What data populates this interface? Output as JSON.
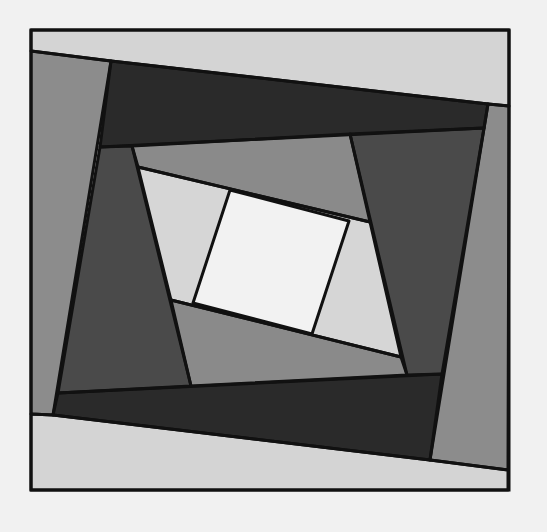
{
  "figure": {
    "frame": {
      "x1": 31,
      "y1": 30,
      "x2": 509,
      "y2": 490,
      "stroke": "#111111"
    },
    "colors": {
      "background": "#f1f1f1",
      "outline": "#111111",
      "center": "#f2f2f2",
      "ring3_light": "#d6d6d6",
      "ring2_medium": "#8a8a8a",
      "ring2_dark": "#4a4a4a",
      "outer_medium": "#8c8c8c",
      "outer_dark": "#2a2a2a",
      "outer_light": "#d4d4d4"
    },
    "pieces": [
      {
        "name": "outer-top-light",
        "fill": "#d4d4d4",
        "points": "31,30 509,30 509,106 488,104 111,61 31,51"
      },
      {
        "name": "outer-bottom-light",
        "fill": "#d4d4d4",
        "points": "31,414 53,415 430,460 508,470 508,490 31,490"
      },
      {
        "name": "outer-left-medium",
        "fill": "#8c8c8c",
        "points": "31,51 111,61 53,415 31,414"
      },
      {
        "name": "outer-right-medium",
        "fill": "#8c8c8c",
        "points": "488,104 509,106 508,470 430,460"
      },
      {
        "name": "outer-top-dark",
        "fill": "#2a2a2a",
        "points": "111,61 488,104 484,128 100,147"
      },
      {
        "name": "outer-bottom-dark",
        "fill": "#2a2a2a",
        "points": "58,393 442,374 430,460 53,415"
      },
      {
        "name": "ring2-left-dark",
        "fill": "#4a4a4a",
        "points": "100,147 132,146 191,386 58,393"
      },
      {
        "name": "ring2-right-dark",
        "fill": "#4a4a4a",
        "points": "350,134 484,128 442,374 407,375"
      },
      {
        "name": "ring2-top-medium",
        "fill": "#8a8a8a",
        "points": "132,146 350,134 370,222 138,167"
      },
      {
        "name": "ring2-bottom-medium",
        "fill": "#8a8a8a",
        "points": "171,300 401,357 407,375 191,386"
      },
      {
        "name": "ring3-light",
        "fill": "#d6d6d6",
        "points": "138,167 370,222 401,357 171,300"
      },
      {
        "name": "center-white",
        "fill": "#f2f2f2",
        "points": "230,190 349,221 312,334 193,303"
      }
    ]
  }
}
